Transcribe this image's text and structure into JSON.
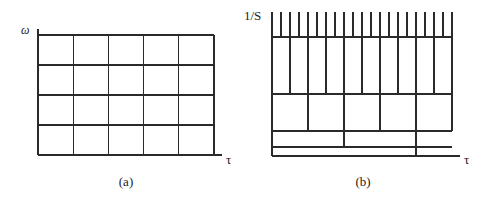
{
  "panels": [
    {
      "id": "a",
      "caption": "(a)",
      "y_axis_label": "ω",
      "x_axis_label": "τ",
      "description": "Uniform time-frequency tiling",
      "grid": {
        "columns": 5,
        "rows": 4
      }
    },
    {
      "id": "b",
      "caption": "(b)",
      "y_axis_label": "1/S",
      "x_axis_label": "τ",
      "description": "Dyadic (wavelet) time-scale tiling",
      "levels": [
        {
          "level": 1,
          "cells": 20
        },
        {
          "level": 2,
          "cells": 10
        },
        {
          "level": 3,
          "cells": 5
        },
        {
          "level": 4,
          "cells": 2.5
        },
        {
          "level": 5,
          "cells": 1.25
        }
      ]
    }
  ],
  "colors": {
    "line": "#2a2a2a",
    "background": "#ffffff"
  }
}
